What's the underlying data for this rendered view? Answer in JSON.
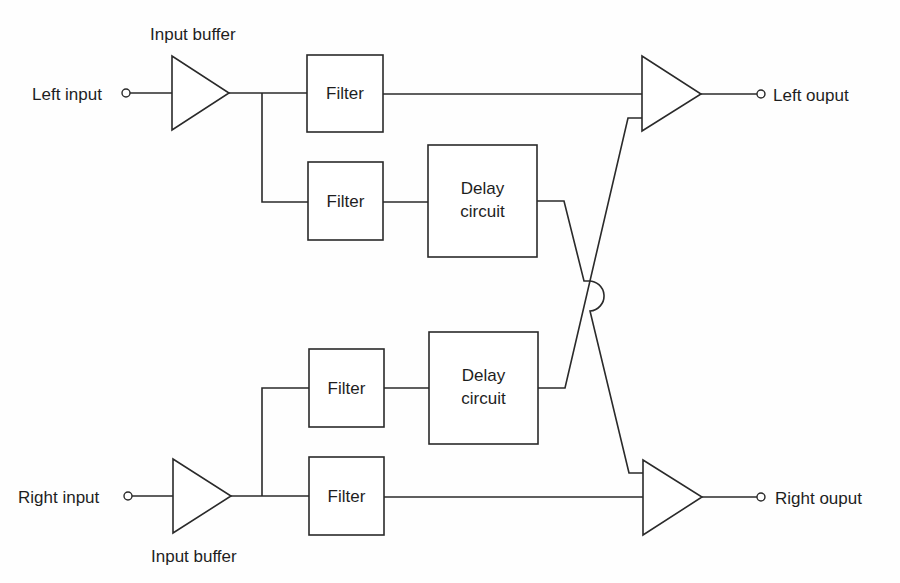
{
  "diagram": {
    "type": "block-diagram",
    "colors": {
      "line": "#2a2a2a",
      "text": "#1e1e1e",
      "background": "#ffffff"
    },
    "inputs": {
      "left": {
        "label": "Left input",
        "icon": "terminal-circle-icon"
      },
      "right": {
        "label": "Right input",
        "icon": "terminal-circle-icon"
      }
    },
    "buffers": {
      "left": {
        "label": "Input buffer",
        "icon": "amplifier-triangle-icon"
      },
      "right": {
        "label": "Input buffer",
        "icon": "amplifier-triangle-icon"
      }
    },
    "filters": [
      {
        "label": "Filter",
        "path": "left-direct"
      },
      {
        "label": "Filter",
        "path": "left-to-delay"
      },
      {
        "label": "Filter",
        "path": "right-to-delay"
      },
      {
        "label": "Filter",
        "path": "right-direct"
      }
    ],
    "delays": [
      {
        "line1": "Delay",
        "line2": "circuit",
        "path": "left-crossfeed"
      },
      {
        "line1": "Delay",
        "line2": "circuit",
        "path": "right-crossfeed"
      }
    ],
    "mixers": {
      "left": {
        "icon": "amplifier-triangle-icon"
      },
      "right": {
        "icon": "amplifier-triangle-icon"
      }
    },
    "outputs": {
      "left": {
        "label": "Left ouput",
        "icon": "terminal-circle-icon"
      },
      "right": {
        "label": "Right ouput",
        "icon": "terminal-circle-icon"
      }
    },
    "crossover": {
      "icon": "wire-hop-icon"
    }
  }
}
